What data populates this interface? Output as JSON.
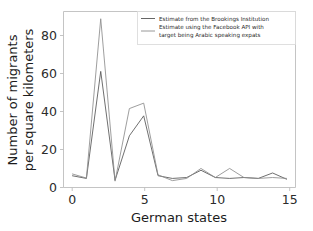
{
  "chart_data": {
    "type": "line",
    "title": "",
    "xlabel": "German states",
    "ylabel": "Number of migrants\nper square kilometers",
    "ylabel_line1": "Number of migrants",
    "ylabel_line2": "per square kilometers",
    "xlim": [
      -0.6,
      15.6
    ],
    "ylim": [
      -3,
      94
    ],
    "xticks": [
      0,
      5,
      10,
      15
    ],
    "yticks": [
      0,
      20,
      40,
      60,
      80
    ],
    "xtick_labels": [
      "0",
      "5",
      "10",
      "15"
    ],
    "ytick_labels": [
      "0",
      "20",
      "40",
      "60",
      "80"
    ],
    "grid": false,
    "legend_position": "upper right",
    "x": [
      0,
      1,
      2,
      3,
      4,
      5,
      6,
      7,
      8,
      9,
      10,
      11,
      12,
      13,
      14,
      15
    ],
    "series": [
      {
        "name": "Estimate from the Brookings Institution",
        "color": "#555555",
        "values": [
          3.5,
          2.0,
          61.0,
          1.0,
          25.5,
          36.5,
          3.5,
          2.0,
          2.5,
          6.5,
          2.5,
          2.0,
          2.5,
          2.0,
          5.0,
          1.5
        ]
      },
      {
        "name": "Estimate using the Facebook API with target being Arabic speaking expats",
        "color": "#8c8c8c",
        "values": [
          4.5,
          2.2,
          90.0,
          0.5,
          40.5,
          43.5,
          4.0,
          0.8,
          2.0,
          7.5,
          2.5,
          7.5,
          2.5,
          2.0,
          2.5,
          2.0
        ]
      }
    ]
  },
  "legend": {
    "entries": [
      {
        "label": "Estimate from the Brookings Institution",
        "label_line1": "Estimate from the Brookings Institution",
        "label_line2": ""
      },
      {
        "label": "Estimate using the Facebook API with target being Arabic speaking expats",
        "label_line1": "Estimate using the Facebook API with",
        "label_line2": "target being Arabic speaking expats"
      }
    ]
  }
}
